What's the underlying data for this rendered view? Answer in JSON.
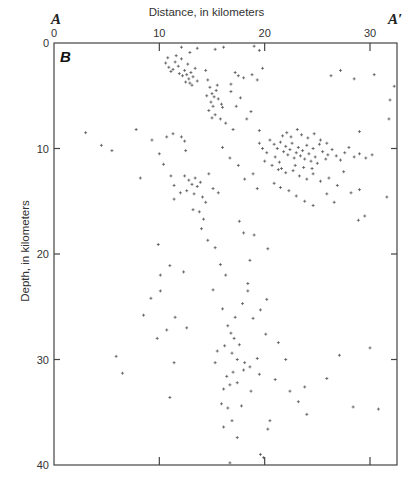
{
  "chart_data": {
    "type": "scatter",
    "title": "Distance, in kilometers",
    "xlabel": "Distance, in kilometers",
    "ylabel": "Depth, in kilometers",
    "panel_label": "B",
    "section_start": "A",
    "section_end": "A′",
    "xlim": [
      0,
      33
    ],
    "ylim": [
      40,
      0
    ],
    "x_ticks": [
      0,
      10,
      20,
      30
    ],
    "y_ticks": [
      0,
      10,
      20,
      30,
      40
    ],
    "grid": false,
    "marker": "+",
    "marker_color": "#555555",
    "series": [
      {
        "name": "Earthquake hypocenters",
        "points": [
          [
            11.5,
            1.8
          ],
          [
            11.8,
            2.2
          ],
          [
            12.1,
            1.5
          ],
          [
            12.4,
            2.6
          ],
          [
            12.6,
            3.0
          ],
          [
            12.8,
            3.4
          ],
          [
            13.0,
            2.8
          ],
          [
            13.2,
            3.2
          ],
          [
            12.9,
            3.8
          ],
          [
            13.4,
            2.4
          ],
          [
            12.2,
            3.1
          ],
          [
            11.9,
            2.9
          ],
          [
            13.1,
            4.0
          ],
          [
            12.7,
            2.0
          ],
          [
            11.6,
            1.2
          ],
          [
            13.6,
            3.6
          ],
          [
            12.5,
            3.7
          ],
          [
            11.3,
            2.5
          ],
          [
            10.6,
            1.9
          ],
          [
            10.9,
            2.3
          ],
          [
            11.1,
            2.7
          ],
          [
            10.8,
            1.4
          ],
          [
            14.6,
            3.5
          ],
          [
            14.8,
            4.2
          ],
          [
            15.0,
            4.8
          ],
          [
            15.2,
            5.1
          ],
          [
            14.9,
            5.6
          ],
          [
            15.4,
            4.5
          ],
          [
            15.1,
            6.0
          ],
          [
            15.6,
            5.3
          ],
          [
            14.7,
            6.4
          ],
          [
            15.3,
            6.8
          ],
          [
            15.8,
            7.2
          ],
          [
            14.5,
            5.0
          ],
          [
            15.5,
            4.0
          ],
          [
            16.0,
            6.1
          ],
          [
            15.9,
            5.8
          ],
          [
            16.3,
            7.6
          ],
          [
            15.0,
            7.1
          ],
          [
            14.4,
            2.6
          ],
          [
            12.1,
            0.4
          ],
          [
            13.6,
            0.5
          ],
          [
            15.3,
            0.6
          ],
          [
            16.1,
            0.4
          ],
          [
            19.0,
            0.3
          ],
          [
            19.5,
            0.7
          ],
          [
            12.9,
            0.9
          ],
          [
            17.2,
            2.8
          ],
          [
            17.5,
            3.1
          ],
          [
            18.0,
            3.3
          ],
          [
            18.8,
            3.0
          ],
          [
            19.3,
            3.5
          ],
          [
            16.8,
            3.9
          ],
          [
            19.8,
            2.4
          ],
          [
            19.5,
            8.3
          ],
          [
            20.5,
            9.2
          ],
          [
            20.9,
            9.6
          ],
          [
            21.2,
            10.0
          ],
          [
            21.5,
            9.4
          ],
          [
            21.8,
            10.3
          ],
          [
            22.0,
            9.8
          ],
          [
            22.2,
            10.6
          ],
          [
            22.4,
            10.1
          ],
          [
            22.6,
            9.5
          ],
          [
            22.8,
            10.9
          ],
          [
            23.0,
            10.4
          ],
          [
            23.2,
            9.9
          ],
          [
            23.4,
            10.7
          ],
          [
            23.6,
            10.2
          ],
          [
            23.8,
            11.0
          ],
          [
            24.0,
            9.7
          ],
          [
            24.2,
            10.5
          ],
          [
            24.4,
            11.2
          ],
          [
            24.6,
            10.0
          ],
          [
            24.8,
            10.8
          ],
          [
            25.0,
            11.4
          ],
          [
            25.2,
            9.6
          ],
          [
            25.5,
            10.3
          ],
          [
            25.8,
            11.0
          ],
          [
            26.0,
            10.6
          ],
          [
            21.0,
            10.8
          ],
          [
            21.4,
            11.3
          ],
          [
            21.7,
            8.8
          ],
          [
            22.1,
            8.5
          ],
          [
            22.5,
            8.9
          ],
          [
            23.1,
            8.2
          ],
          [
            23.5,
            8.7
          ],
          [
            24.1,
            9.0
          ],
          [
            24.7,
            8.6
          ],
          [
            25.3,
            9.2
          ],
          [
            25.9,
            9.5
          ],
          [
            26.4,
            10.1
          ],
          [
            26.8,
            10.7
          ],
          [
            27.2,
            11.1
          ],
          [
            27.6,
            10.4
          ],
          [
            28.0,
            9.9
          ],
          [
            28.5,
            10.8
          ],
          [
            29.0,
            10.5
          ],
          [
            29.6,
            10.9
          ],
          [
            30.2,
            10.6
          ],
          [
            20.2,
            10.4
          ],
          [
            19.8,
            10.0
          ],
          [
            19.5,
            9.5
          ],
          [
            20.0,
            11.2
          ],
          [
            20.7,
            11.6
          ],
          [
            21.3,
            12.0
          ],
          [
            22.0,
            12.3
          ],
          [
            22.7,
            12.1
          ],
          [
            23.3,
            12.6
          ],
          [
            24.0,
            12.9
          ],
          [
            24.6,
            12.4
          ],
          [
            25.3,
            13.1
          ],
          [
            26.1,
            12.8
          ],
          [
            26.9,
            13.5
          ],
          [
            27.5,
            12.2
          ],
          [
            28.2,
            14.2
          ],
          [
            22.9,
            11.6
          ],
          [
            23.7,
            11.8
          ],
          [
            24.5,
            11.9
          ],
          [
            21.6,
            11.9
          ],
          [
            22.3,
            14.0
          ],
          [
            23.0,
            14.5
          ],
          [
            23.8,
            15.0
          ],
          [
            24.6,
            15.4
          ],
          [
            21.5,
            13.7
          ],
          [
            25.9,
            14.3
          ],
          [
            20.9,
            13.3
          ],
          [
            26.6,
            15.1
          ],
          [
            28.9,
            16.8
          ],
          [
            29.5,
            16.4
          ],
          [
            31.6,
            14.6
          ],
          [
            29.0,
            13.9
          ],
          [
            12.4,
            12.6
          ],
          [
            12.8,
            13.0
          ],
          [
            13.1,
            13.4
          ],
          [
            13.4,
            12.8
          ],
          [
            13.6,
            13.6
          ],
          [
            13.9,
            13.2
          ],
          [
            12.6,
            14.0
          ],
          [
            13.3,
            14.3
          ],
          [
            14.1,
            14.6
          ],
          [
            14.4,
            15.1
          ],
          [
            13.8,
            16.0
          ],
          [
            14.2,
            16.7
          ],
          [
            14.0,
            17.6
          ],
          [
            13.2,
            15.8
          ],
          [
            12.0,
            14.2
          ],
          [
            11.4,
            14.8
          ],
          [
            15.1,
            13.8
          ],
          [
            15.6,
            14.2
          ],
          [
            14.7,
            12.4
          ],
          [
            14.6,
            18.7
          ],
          [
            15.3,
            19.4
          ],
          [
            15.8,
            21.0
          ],
          [
            16.3,
            22.0
          ],
          [
            15.1,
            23.4
          ],
          [
            12.3,
            21.7
          ],
          [
            9.9,
            19.1
          ],
          [
            10.1,
            22.0
          ],
          [
            10.1,
            23.5
          ],
          [
            10.7,
            27.2
          ],
          [
            11.5,
            26.0
          ],
          [
            12.6,
            27.0
          ],
          [
            11.0,
            21.1
          ],
          [
            9.8,
            28.0
          ],
          [
            16.5,
            26.8
          ],
          [
            16.8,
            27.5
          ],
          [
            17.1,
            28.0
          ],
          [
            17.6,
            28.6
          ],
          [
            16.2,
            28.7
          ],
          [
            16.9,
            29.4
          ],
          [
            17.4,
            30.0
          ],
          [
            18.1,
            30.3
          ],
          [
            15.5,
            29.2
          ],
          [
            15.3,
            30.3
          ],
          [
            16.4,
            31.6
          ],
          [
            17.0,
            31.2
          ],
          [
            16.7,
            32.4
          ],
          [
            16.1,
            32.8
          ],
          [
            17.4,
            32.2
          ],
          [
            18.0,
            31.0
          ],
          [
            18.6,
            30.7
          ],
          [
            19.3,
            29.9
          ],
          [
            19.5,
            31.4
          ],
          [
            18.7,
            33.0
          ],
          [
            15.9,
            34.2
          ],
          [
            16.5,
            34.6
          ],
          [
            17.8,
            34.4
          ],
          [
            16.9,
            35.8
          ],
          [
            16.1,
            36.4
          ],
          [
            17.4,
            37.4
          ],
          [
            18.9,
            26.1
          ],
          [
            18.4,
            23.5
          ],
          [
            19.6,
            25.3
          ],
          [
            20.1,
            27.6
          ],
          [
            21.3,
            28.4
          ],
          [
            22.4,
            33.0
          ],
          [
            22.0,
            30.0
          ],
          [
            23.2,
            34.0
          ],
          [
            24.0,
            35.2
          ],
          [
            20.5,
            35.8
          ],
          [
            20.3,
            36.6
          ],
          [
            21.0,
            31.9
          ],
          [
            17.9,
            24.7
          ],
          [
            16.0,
            25.2
          ],
          [
            17.2,
            26.0
          ],
          [
            28.4,
            34.5
          ],
          [
            30.8,
            34.7
          ],
          [
            30.0,
            28.9
          ],
          [
            27.1,
            29.6
          ],
          [
            25.9,
            31.8
          ],
          [
            23.8,
            32.6
          ],
          [
            6.5,
            31.3
          ],
          [
            11.0,
            33.6
          ],
          [
            11.4,
            30.3
          ],
          [
            8.5,
            25.8
          ],
          [
            9.2,
            24.2
          ],
          [
            5.9,
            29.7
          ],
          [
            16.7,
            39.8
          ],
          [
            19.6,
            39.0
          ],
          [
            19.9,
            39.3
          ],
          [
            7.8,
            8.2
          ],
          [
            9.3,
            9.2
          ],
          [
            10.7,
            8.9
          ],
          [
            11.3,
            8.6
          ],
          [
            12.1,
            8.9
          ],
          [
            12.4,
            9.3
          ],
          [
            10.0,
            10.5
          ],
          [
            10.4,
            11.5
          ],
          [
            11.1,
            12.6
          ],
          [
            11.4,
            13.5
          ],
          [
            12.5,
            10.2
          ],
          [
            8.2,
            12.8
          ],
          [
            3.0,
            8.5
          ],
          [
            4.5,
            9.7
          ],
          [
            5.5,
            10.2
          ],
          [
            31.8,
            7.2
          ],
          [
            32.3,
            4.1
          ],
          [
            31.9,
            5.4
          ],
          [
            29.0,
            8.4
          ],
          [
            28.5,
            3.4
          ],
          [
            30.4,
            3.0
          ],
          [
            27.2,
            2.6
          ],
          [
            26.3,
            3.1
          ],
          [
            17.6,
            16.9
          ],
          [
            18.0,
            18.0
          ],
          [
            19.0,
            18.2
          ],
          [
            20.3,
            19.5
          ],
          [
            18.6,
            20.6
          ],
          [
            18.4,
            22.8
          ],
          [
            20.2,
            24.3
          ],
          [
            16.0,
            9.9
          ],
          [
            16.7,
            10.9
          ],
          [
            17.5,
            11.6
          ],
          [
            18.1,
            12.9
          ],
          [
            18.9,
            12.4
          ],
          [
            19.3,
            13.8
          ],
          [
            17.0,
            8.2
          ],
          [
            18.3,
            7.2
          ],
          [
            18.7,
            6.5
          ],
          [
            17.7,
            5.2
          ],
          [
            16.8,
            4.6
          ],
          [
            17.3,
            6.0
          ]
        ]
      }
    ]
  },
  "labels": {
    "section_start": "A",
    "section_end": "A′",
    "x_title": "Distance, in kilometers",
    "y_title": "Depth, in kilometers",
    "panel": "B"
  }
}
